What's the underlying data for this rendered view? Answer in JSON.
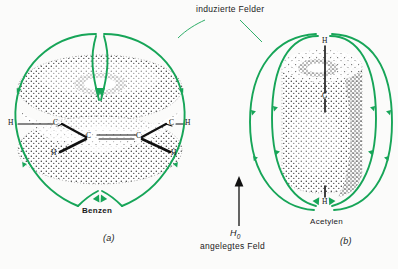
{
  "figure": {
    "title_text": "induzierte Felder",
    "applied_field_symbol": "H",
    "applied_field_subscript": "0",
    "applied_field_caption": "angelegtes Feld",
    "background_color": "#fbfbfa",
    "field_line_color": "#17a558",
    "bond_color": "#111111",
    "cloud_color": "#2b2b2b"
  },
  "panels": [
    {
      "id": "a",
      "panel_label": "(a)",
      "molecule_name": "Benzen",
      "cloud_shape": "torus",
      "atoms": [
        {
          "label": "H",
          "x": 10,
          "y": 121
        },
        {
          "label": "C",
          "x": 56,
          "y": 121
        },
        {
          "label": "C",
          "x": 89,
          "y": 135
        },
        {
          "label": "C",
          "x": 139,
          "y": 135
        },
        {
          "label": "C",
          "x": 172,
          "y": 121
        },
        {
          "label": "H",
          "x": 186,
          "y": 121
        },
        {
          "label": "H",
          "x": 50,
          "y": 152
        },
        {
          "label": "H",
          "x": 178,
          "y": 152
        }
      ]
    },
    {
      "id": "b",
      "panel_label": "(b)",
      "molecule_name": "Acetylen",
      "cloud_shape": "cylinder",
      "atoms": [
        {
          "label": "H",
          "x": 322,
          "y": 40
        },
        {
          "label": "C",
          "x": 322,
          "y": 96
        },
        {
          "label": "H",
          "x": 322,
          "y": 201
        }
      ]
    }
  ]
}
